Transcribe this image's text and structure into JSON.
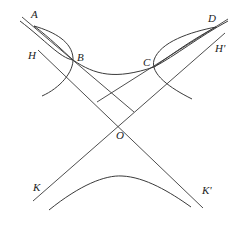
{
  "diagram": {
    "type": "geometric-construction",
    "stroke_color": "#3a3a3a",
    "labels": {
      "A": "A",
      "B": "B",
      "C": "C",
      "D": "D",
      "H": "H",
      "H_prime": "H'",
      "O": "O",
      "K": "K",
      "K_prime": "K'"
    },
    "points": {
      "A": [
        34,
        26
      ],
      "B": [
        73,
        60
      ],
      "C": [
        154,
        67
      ],
      "D": [
        216,
        27
      ],
      "O": [
        120,
        124
      ]
    },
    "lines": [
      {
        "name": "asymptote-H-K-prime",
        "from": [
          38,
          50
        ],
        "to": [
          203,
          208
        ]
      },
      {
        "name": "asymptote-H-prime-K",
        "from": [
          225,
          33
        ],
        "to": [
          33,
          201
        ]
      },
      {
        "name": "chord-line-AB",
        "from": [
          22,
          17
        ],
        "to": [
          134,
          112
        ]
      },
      {
        "name": "chord-line-DC",
        "from": [
          228,
          19
        ],
        "to": [
          97,
          102
        ]
      }
    ]
  }
}
